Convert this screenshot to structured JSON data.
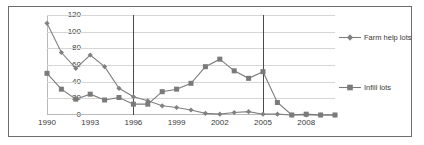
{
  "chart_data": {
    "type": "line",
    "title": "",
    "subtitle": "",
    "xlabel": "",
    "ylabel": "",
    "xlim": [
      1990,
      2010
    ],
    "ylim": [
      0,
      120
    ],
    "ytick_labels": [
      "120",
      "100",
      "80",
      "60",
      "40",
      "20",
      "0"
    ],
    "ytick_values": [
      120,
      100,
      80,
      60,
      40,
      20,
      0
    ],
    "xtick_labels": [
      "1990",
      "1993",
      "1996",
      "1999",
      "2002",
      "2005",
      "2008"
    ],
    "xtick_values": [
      1990,
      1993,
      1996,
      1999,
      2002,
      2005,
      2008
    ],
    "x": [
      1990,
      1991,
      1992,
      1993,
      1994,
      1995,
      1996,
      1997,
      1998,
      1999,
      2000,
      2001,
      2002,
      2003,
      2004,
      2005,
      2006,
      2007,
      2008,
      2009,
      2010
    ],
    "grid": true,
    "grid_axis": "y",
    "legend_position": "right",
    "annotations": [
      {
        "type": "vertical-line",
        "x": 1996,
        "label": "1996"
      },
      {
        "type": "vertical-line",
        "x": 2005,
        "label": "2005"
      }
    ],
    "series": [
      {
        "name": "Farm help lots",
        "marker": "diamond",
        "color": "#808080",
        "values": [
          110,
          75,
          56,
          72,
          58,
          32,
          22,
          17,
          11,
          9,
          6,
          2,
          1,
          3,
          4,
          1,
          1,
          0,
          0,
          0,
          0
        ]
      },
      {
        "name": "Infill lots",
        "marker": "square",
        "color": "#7a7a7a",
        "values": [
          50,
          31,
          19,
          25,
          18,
          21,
          13,
          13,
          28,
          31,
          38,
          58,
          67,
          53,
          44,
          52,
          15,
          0,
          1,
          0,
          0
        ]
      }
    ]
  },
  "legend": {
    "entries": [
      {
        "label": "Farm help lots",
        "marker": "diamond",
        "color": "#808080"
      },
      {
        "label": "Infill lots",
        "marker": "square",
        "color": "#7a7a7a"
      }
    ]
  },
  "caption_remnant": ""
}
